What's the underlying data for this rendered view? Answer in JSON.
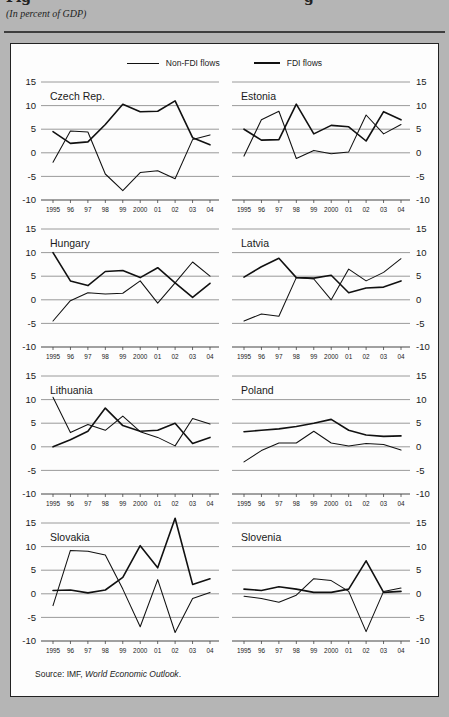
{
  "page": {
    "title_fragments": [
      "Fig",
      "g"
    ],
    "subtitle": "(In percent of GDP)",
    "source_prefix": "Source: IMF, ",
    "source_italic": "World Economic Outlook",
    "source_suffix": "."
  },
  "legend": [
    {
      "label": "Non-FDI flows"
    },
    {
      "label": "FDI flows"
    }
  ],
  "colors": {
    "line": "#111111",
    "gridline": "#8f8f8f",
    "axis": "#444444",
    "background_outer": "#b5b5b5",
    "background_figure": "#fdfdfd"
  },
  "chart_data": {
    "type": "line",
    "x": [
      "1995",
      "96",
      "97",
      "98",
      "99",
      "2000",
      "01",
      "02",
      "03",
      "04"
    ],
    "ylim": [
      -10,
      15
    ],
    "yticks": [
      15,
      10,
      5,
      0,
      -5,
      -10
    ],
    "grid": "horizontal",
    "legend_position": "top",
    "panels": [
      {
        "title": "Czech Rep.",
        "labels": "left",
        "series": [
          {
            "name": "Non-FDI flows",
            "values": [
              -2,
              4.6,
              4.4,
              -4.5,
              -8,
              -4.2,
              -3.8,
              -5.5,
              2.8,
              3.8
            ]
          },
          {
            "name": "FDI flows",
            "values": [
              4.5,
              2,
              2.3,
              6,
              10.3,
              8.7,
              8.8,
              11,
              3.2,
              1.7
            ]
          }
        ]
      },
      {
        "title": "Estonia",
        "labels": "right",
        "series": [
          {
            "name": "Non-FDI flows",
            "values": [
              -0.7,
              7,
              8.8,
              -1.2,
              0.5,
              -0.2,
              0.2,
              8,
              4,
              6
            ]
          },
          {
            "name": "FDI flows",
            "values": [
              5,
              2.7,
              2.8,
              10.3,
              4,
              5.8,
              5.5,
              2.5,
              8.7,
              7
            ]
          }
        ]
      },
      {
        "title": "Hungary",
        "labels": "left",
        "series": [
          {
            "name": "Non-FDI flows",
            "values": [
              -4.5,
              -0.2,
              1.5,
              1.2,
              1.4,
              4,
              -0.7,
              3.6,
              8,
              5
            ]
          },
          {
            "name": "FDI flows",
            "values": [
              10,
              4,
              3,
              6,
              6.2,
              4.7,
              6.8,
              3.6,
              0.5,
              3.5
            ]
          }
        ]
      },
      {
        "title": "Latvia",
        "labels": "right",
        "series": [
          {
            "name": "Non-FDI flows",
            "values": [
              -4.5,
              -3,
              -3.5,
              4.7,
              4.4,
              0,
              6.5,
              4,
              5.8,
              8.7
            ]
          },
          {
            "name": "FDI flows",
            "values": [
              4.8,
              7,
              8.8,
              4.7,
              4.6,
              5.2,
              1.5,
              2.5,
              2.7,
              4
            ]
          }
        ]
      },
      {
        "title": "Lithuania",
        "labels": "left",
        "series": [
          {
            "name": "Non-FDI flows",
            "values": [
              10.5,
              3,
              4.7,
              3.5,
              6.5,
              3.2,
              2,
              0.2,
              6,
              4.8
            ]
          },
          {
            "name": "FDI flows",
            "values": [
              0,
              1.5,
              3.3,
              8.2,
              4.5,
              3.3,
              3.5,
              5,
              0.7,
              2
            ]
          }
        ]
      },
      {
        "title": "Poland",
        "labels": "right",
        "series": [
          {
            "name": "Non-FDI flows",
            "values": [
              -3.2,
              -0.8,
              0.8,
              0.8,
              3.3,
              0.8,
              0.2,
              0.7,
              0.5,
              -0.7
            ]
          },
          {
            "name": "FDI flows",
            "values": [
              3.2,
              3.5,
              3.8,
              4.3,
              5,
              5.8,
              3.5,
              2.5,
              2.2,
              2.3
            ]
          }
        ]
      },
      {
        "title": "Slovakia",
        "labels": "left",
        "series": [
          {
            "name": "Non-FDI flows",
            "values": [
              -2.5,
              9.2,
              9,
              8.2,
              1,
              -7,
              3,
              -8.2,
              -1,
              0.3
            ]
          },
          {
            "name": "FDI flows",
            "values": [
              0.7,
              0.8,
              0.2,
              0.8,
              3.5,
              10.2,
              5.5,
              16,
              2,
              3.2
            ]
          }
        ]
      },
      {
        "title": "Slovenia",
        "labels": "right",
        "series": [
          {
            "name": "Non-FDI flows",
            "values": [
              -0.5,
              -1,
              -1.8,
              -0.3,
              3.2,
              2.8,
              0.5,
              -8,
              0.5,
              1.2
            ]
          },
          {
            "name": "FDI flows",
            "values": [
              1,
              0.7,
              1.5,
              1,
              0.3,
              0.3,
              1,
              7,
              0.3,
              0.5
            ]
          }
        ]
      }
    ]
  }
}
